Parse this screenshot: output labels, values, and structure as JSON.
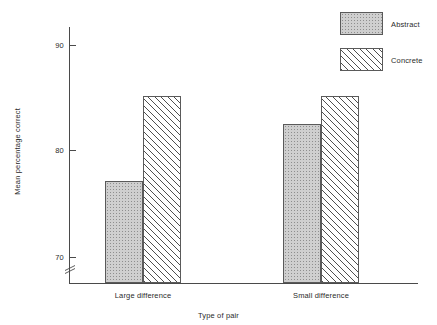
{
  "chart_data": {
    "type": "bar",
    "title": "",
    "subtitle": "",
    "xlabel": "Type of pair",
    "ylabel": "Mean percentage correct",
    "categories": [
      "Large difference",
      "Small difference"
    ],
    "series": [
      {
        "name": "Abstract",
        "values": [
          77.1,
          82.5
        ],
        "fill": "stipple"
      },
      {
        "name": "Concrete",
        "values": [
          85.1,
          85.1
        ],
        "fill": "diagonal-hatch"
      }
    ],
    "yticks": [
      70,
      80,
      90
    ],
    "ytick_labels": [
      "70",
      "80",
      "90"
    ],
    "ylim": [
      67.5,
      92.0
    ],
    "y_axis_break": true,
    "grid": false,
    "legend_position": "top-right",
    "annotations": [],
    "colors": {
      "axis": "#4a4a4a",
      "text": "#2b2b2b",
      "abstract_fill": "#cfcfcf",
      "concrete_fill": "#ffffff",
      "bar_border": "#5a5a5a",
      "background": "#ffffff"
    }
  },
  "axis": {
    "y_tick_0": "70",
    "y_tick_1": "80",
    "y_tick_2": "90",
    "y_title": "Mean percentage correct",
    "x_title": "Type of pair",
    "x_cat_0": "Large difference",
    "x_cat_1": "Small difference"
  },
  "legend": {
    "items": [
      {
        "label": "Abstract",
        "swatch": "stipple-swatch-icon"
      },
      {
        "label": "Concrete",
        "swatch": "hatch-swatch-icon"
      }
    ]
  }
}
